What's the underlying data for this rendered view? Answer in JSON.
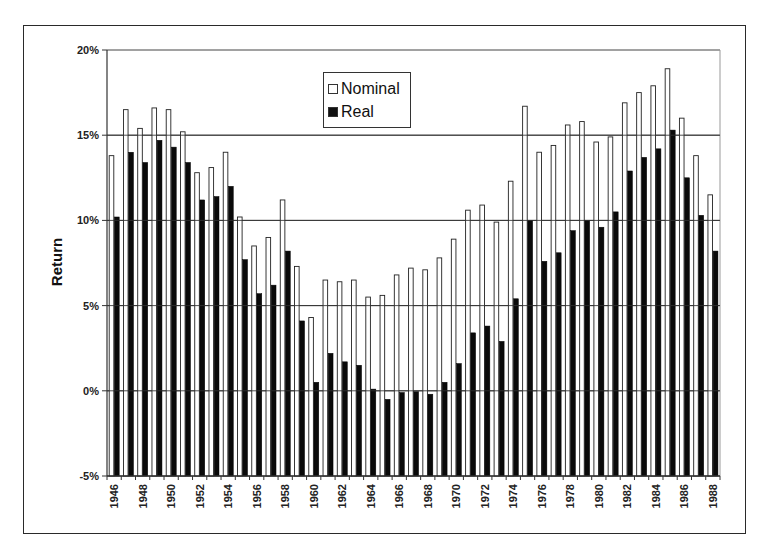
{
  "chart_data": {
    "type": "bar",
    "title": "",
    "xlabel": "",
    "ylabel": "Return",
    "ylim": [
      -5,
      20
    ],
    "yticks": [
      "20%",
      "15%",
      "10%",
      "5%",
      "0%",
      "-5%"
    ],
    "ytick_values": [
      20,
      15,
      10,
      5,
      0,
      -5
    ],
    "grid": "horizontal",
    "legend_position": "upper center (inside plot)",
    "categories": [
      "1946",
      "1947",
      "1948",
      "1949",
      "1950",
      "1951",
      "1952",
      "1953",
      "1954",
      "1955",
      "1956",
      "1957",
      "1958",
      "1959",
      "1960",
      "1961",
      "1962",
      "1963",
      "1964",
      "1965",
      "1966",
      "1967",
      "1968",
      "1969",
      "1970",
      "1971",
      "1972",
      "1973",
      "1974",
      "1975",
      "1976",
      "1977",
      "1978",
      "1979",
      "1980",
      "1981",
      "1982",
      "1983",
      "1984",
      "1985",
      "1986",
      "1987",
      "1988"
    ],
    "xtick_labels": [
      "1946",
      "1948",
      "1950",
      "1952",
      "1954",
      "1956",
      "1958",
      "1960",
      "1962",
      "1964",
      "1966",
      "1968",
      "1970",
      "1972",
      "1974",
      "1976",
      "1978",
      "1980",
      "1982",
      "1984",
      "1986",
      "1988"
    ],
    "series": [
      {
        "name": "Nominal",
        "color": "#ffffff",
        "values": [
          13.8,
          16.5,
          15.4,
          16.6,
          16.5,
          15.2,
          12.8,
          13.1,
          14.0,
          10.2,
          8.5,
          9.0,
          11.2,
          7.3,
          4.3,
          6.5,
          6.4,
          6.5,
          5.5,
          5.6,
          6.8,
          7.2,
          7.1,
          7.8,
          8.9,
          10.6,
          10.9,
          9.9,
          12.3,
          16.7,
          14.0,
          14.4,
          15.6,
          15.8,
          14.6,
          14.9,
          16.9,
          17.5,
          17.9,
          18.9,
          16.0,
          13.8,
          11.5
        ]
      },
      {
        "name": "Real",
        "color": "#000000",
        "values": [
          10.2,
          14.0,
          13.4,
          14.7,
          14.3,
          13.4,
          11.2,
          11.4,
          12.0,
          7.7,
          5.7,
          6.2,
          8.2,
          4.1,
          0.5,
          2.2,
          1.7,
          1.5,
          0.1,
          -0.5,
          -0.1,
          -0.05,
          -0.2,
          0.5,
          1.6,
          3.4,
          3.8,
          2.9,
          5.4,
          10.0,
          7.6,
          8.1,
          9.4,
          10.0,
          9.6,
          10.5,
          12.9,
          13.7,
          14.2,
          15.3,
          12.5,
          10.3,
          8.2
        ]
      }
    ]
  },
  "legend": {
    "items": [
      {
        "label": "Nominal",
        "color": "#ffffff"
      },
      {
        "label": "Real",
        "color": "#000000"
      }
    ]
  },
  "axis": {
    "ylabel": "Return"
  }
}
